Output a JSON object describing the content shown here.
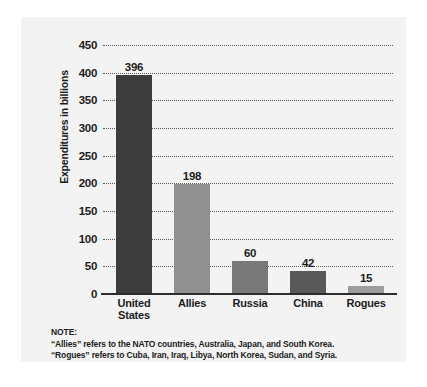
{
  "chart_data": {
    "type": "bar",
    "title": "",
    "xlabel": "",
    "ylabel": "Expenditures in billions",
    "ylim": [
      0,
      450
    ],
    "grid": true,
    "legend": "none",
    "categories": [
      "United States",
      "Allies",
      "Russia",
      "China",
      "Rogues"
    ],
    "category_lines": [
      [
        "United",
        "States"
      ],
      [
        "Allies"
      ],
      [
        "Russia"
      ],
      [
        "China"
      ],
      [
        "Rogues"
      ]
    ],
    "values": [
      396,
      198,
      60,
      42,
      15
    ],
    "value_labels": [
      "396",
      "198",
      "60",
      "42",
      "15"
    ],
    "bar_colors": [
      "#3c3c3c",
      "#909090",
      "#787878",
      "#595959",
      "#9c9c9c"
    ],
    "yticks": [
      450,
      400,
      350,
      300,
      250,
      200,
      150,
      100,
      50,
      0
    ],
    "ytick_labels": [
      "450",
      "400",
      "350",
      "300",
      "250",
      "200",
      "150",
      "100",
      "50",
      "0"
    ]
  },
  "note": {
    "heading": "NOTE:",
    "lines": [
      "“Allies” refers to the NATO countries, Australia, Japan, and South Korea.",
      "“Rogues” refers to Cuba, Iran, Iraq, Libya, North Korea, Sudan, and Syria."
    ]
  },
  "colors": {
    "panel_background": "#f3f3f3",
    "page_background": "#ffffff",
    "axis": "#2c2c2c",
    "gridline": "#5c5c5c",
    "text": "#1c1c1c"
  }
}
